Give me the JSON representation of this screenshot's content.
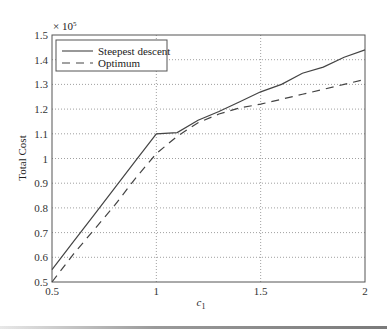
{
  "chart_data": {
    "type": "line",
    "title": "",
    "xlabel": "c1",
    "xlabel_base": "c",
    "xlabel_sub": "1",
    "ylabel": "Total Cost",
    "y_multiplier": "× 10",
    "y_multiplier_exp": "5",
    "xlim": [
      0.5,
      2
    ],
    "ylim": [
      0.5,
      1.5
    ],
    "xticks": [
      0.5,
      1,
      1.5,
      2
    ],
    "xtick_labels": [
      "0.5",
      "1",
      "1.5",
      "2"
    ],
    "yticks": [
      0.5,
      0.6,
      0.7,
      0.8,
      0.9,
      1.0,
      1.1,
      1.2,
      1.3,
      1.4,
      1.5
    ],
    "ytick_labels": [
      "0.5",
      "0.6",
      "0.7",
      "0.8",
      "0.9",
      "1",
      "1.1",
      "1.2",
      "1.3",
      "1.4",
      "1.5"
    ],
    "grid": true,
    "legend_position": "upper left",
    "series": [
      {
        "name": "Steepest descent",
        "style": "solid",
        "color": "#444444",
        "x": [
          0.5,
          0.6,
          0.7,
          0.8,
          0.9,
          1.0,
          1.1,
          1.2,
          1.3,
          1.4,
          1.5,
          1.6,
          1.7,
          1.8,
          1.9,
          2.0
        ],
        "y": [
          0.55,
          0.66,
          0.77,
          0.88,
          0.99,
          1.1,
          1.105,
          1.155,
          1.19,
          1.23,
          1.27,
          1.3,
          1.345,
          1.37,
          1.41,
          1.44
        ]
      },
      {
        "name": "Optimum",
        "style": "dashed",
        "color": "#444444",
        "x": [
          0.5,
          0.6,
          0.7,
          0.8,
          0.9,
          1.0,
          1.1,
          1.2,
          1.3,
          1.4,
          1.5,
          1.6,
          1.7,
          1.8,
          1.9,
          2.0
        ],
        "y": [
          0.5,
          0.61,
          0.71,
          0.81,
          0.92,
          1.02,
          1.09,
          1.145,
          1.18,
          1.205,
          1.22,
          1.24,
          1.26,
          1.28,
          1.3,
          1.32
        ]
      }
    ]
  }
}
